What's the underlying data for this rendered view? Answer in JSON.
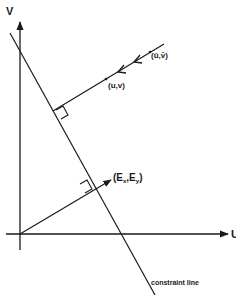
{
  "diagram": {
    "type": "vector-geometry",
    "colors": {
      "ink": "#1a1a1a",
      "background": "#ffffff"
    },
    "axes": {
      "vertical_label": "V",
      "horizontal_label": "U"
    },
    "points": {
      "estimate_label": "(ū,v̄)",
      "solution_label": "(u,v)",
      "gradient_label": "(Ex,Ey)"
    },
    "gradient": {
      "open": "(E",
      "x": "x",
      "comma": ",E",
      "y": "y",
      "close": ")"
    },
    "constraint_line_label": "constraint  line"
  }
}
